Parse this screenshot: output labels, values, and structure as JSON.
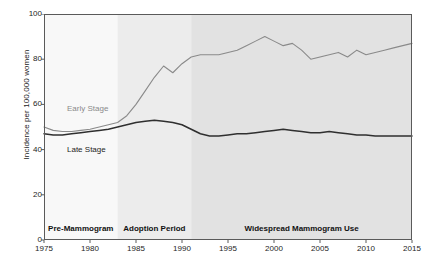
{
  "chart_data": {
    "type": "line",
    "title": "",
    "xlabel": "",
    "ylabel": "Incidence per 100,000 women",
    "xlim": [
      1975,
      2015
    ],
    "ylim": [
      0,
      100
    ],
    "grid": false,
    "legend_position": "inline-annotations",
    "xticks": [
      "1975",
      "1980",
      "1985",
      "1990",
      "1995",
      "2000",
      "2005",
      "2010",
      "2015"
    ],
    "yticks": [
      "0",
      "20",
      "40",
      "60",
      "80",
      "100"
    ],
    "x": [
      1975,
      1976,
      1977,
      1978,
      1979,
      1980,
      1981,
      1982,
      1983,
      1984,
      1985,
      1986,
      1987,
      1988,
      1989,
      1990,
      1991,
      1992,
      1993,
      1994,
      1995,
      1996,
      1997,
      1998,
      1999,
      2000,
      2001,
      2002,
      2003,
      2004,
      2005,
      2006,
      2007,
      2008,
      2009,
      2010,
      2011,
      2012,
      2013,
      2014,
      2015
    ],
    "series": [
      {
        "name": "Early Stage",
        "color": "#8a8a8a",
        "values": [
          50,
          48.5,
          48,
          48,
          48.5,
          49,
          50,
          51,
          52,
          55,
          60,
          66,
          72,
          77,
          74,
          78,
          81,
          82,
          82,
          82,
          83,
          84,
          86,
          88,
          90,
          88,
          86,
          87,
          84,
          80,
          81,
          82,
          83,
          81,
          84,
          82,
          83,
          84,
          85,
          86,
          87
        ]
      },
      {
        "name": "Late Stage",
        "color": "#2f2f2f",
        "values": [
          47,
          46.5,
          46.5,
          47,
          47.5,
          48,
          48.5,
          49,
          50,
          51,
          52,
          52.5,
          53,
          52.5,
          52,
          51,
          49,
          47,
          46,
          46,
          46.5,
          47,
          47,
          47.5,
          48,
          48.5,
          49,
          48.5,
          48,
          47.5,
          47.5,
          48,
          47.5,
          47,
          46.5,
          46.5,
          46,
          46,
          46,
          46,
          46
        ]
      }
    ],
    "bands": [
      {
        "label": "Pre-Mammogram",
        "start": 1975,
        "end": 1983,
        "color": "#f8f8f8"
      },
      {
        "label": "Adoption Period",
        "start": 1983,
        "end": 1991,
        "color": "#ececec"
      },
      {
        "label": "Widespread Mammogram Use",
        "start": 1991,
        "end": 2015,
        "color": "#e2e2e2"
      }
    ],
    "annotations": [
      {
        "text": "Early Stage",
        "x": 1977.5,
        "y": 58,
        "color": "#8a8a8a"
      },
      {
        "text": "Late Stage",
        "x": 1977.5,
        "y": 40,
        "color": "#1d1d1d"
      }
    ]
  }
}
